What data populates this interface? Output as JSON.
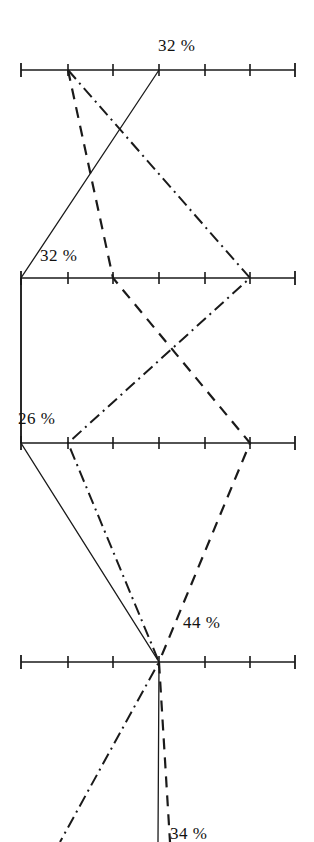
{
  "figure": {
    "type": "parallel-coordinates",
    "background": "#ffffff",
    "ink": "#1a1a1a",
    "width": 314,
    "height": 842
  },
  "labels": [
    {
      "name": "label-32-top",
      "text": "32 %",
      "x": 158,
      "y": 36
    },
    {
      "name": "label-32-second",
      "text": "32 %",
      "x": 40,
      "y": 246
    },
    {
      "name": "label-26-third",
      "text": "26 %",
      "x": 18,
      "y": 409
    },
    {
      "name": "label-44-fourth",
      "text": "44 %",
      "x": 183,
      "y": 613
    },
    {
      "name": "label-34-bottom-clipped",
      "text": "34 %",
      "x": 170,
      "y": 824
    }
  ],
  "chart_data": {
    "type": "line",
    "title": "",
    "xlabel": "",
    "ylabel": "",
    "grid": false,
    "legend": "none",
    "axes": [
      {
        "name": "axis-1",
        "y": 70,
        "x_start": 21,
        "x_end": 295,
        "ticks": [
          21,
          68,
          113,
          159,
          205,
          250,
          295
        ],
        "value_label": "32 %"
      },
      {
        "name": "axis-2",
        "y": 278,
        "x_start": 21,
        "x_end": 295,
        "ticks": [
          21,
          68,
          113,
          159,
          205,
          250,
          295
        ],
        "value_label": "32 %"
      },
      {
        "name": "axis-3",
        "y": 443,
        "x_start": 21,
        "x_end": 295,
        "ticks": [
          21,
          68,
          113,
          159,
          205,
          250,
          295
        ],
        "value_label": "26 %"
      },
      {
        "name": "axis-4",
        "y": 662,
        "x_start": 21,
        "x_end": 295,
        "ticks": [
          21,
          68,
          113,
          159,
          205,
          250,
          295
        ],
        "value_label": "44 %"
      }
    ],
    "tick_count": 7,
    "tick_spacing": 45.7,
    "series": [
      {
        "name": "series-solid",
        "style": "solid",
        "dasharray": "",
        "width": 1.3,
        "points": [
          [
            159,
            70
          ],
          [
            21,
            278
          ],
          [
            21,
            443
          ],
          [
            159,
            662
          ],
          [
            158,
            842
          ]
        ]
      },
      {
        "name": "series-dashed",
        "style": "dashed",
        "dasharray": "11 8",
        "width": 2.2,
        "points": [
          [
            68,
            70
          ],
          [
            113,
            278
          ],
          [
            250,
            443
          ],
          [
            159,
            662
          ],
          [
            170,
            842
          ]
        ]
      },
      {
        "name": "series-dashdot",
        "style": "dash-dot",
        "dasharray": "12 5 2 5",
        "width": 2.0,
        "points": [
          [
            68,
            70
          ],
          [
            250,
            278
          ],
          [
            68,
            443
          ],
          [
            159,
            662
          ],
          [
            60,
            842
          ]
        ]
      }
    ],
    "left_connector": {
      "name": "left-vertical-connector",
      "from": [
        21,
        278
      ],
      "to": [
        21,
        443
      ],
      "style": "solid"
    }
  }
}
